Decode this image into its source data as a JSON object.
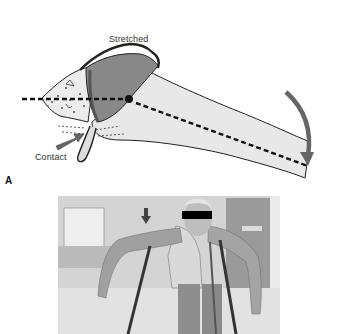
{
  "figure": {
    "panel_label": "A",
    "diagram": {
      "labels": {
        "stretched": "Stretched",
        "contact": "Contact"
      },
      "icons": {
        "rotation_arrow": "curved-arrow-down",
        "contact_arrow": "straight-arrow-right"
      },
      "colors": {
        "humeral_head": "#8a8a8a",
        "bone": "#e6e6e6",
        "arrow": "#666666",
        "outline": "#222222"
      }
    },
    "photo": {
      "description": "Grayscale photo of a person leaning forward with arms abducted between parallel bars; face obscured by black bar",
      "icons": {
        "indicator_arrow": "arrow-down",
        "censor_bar": "black-rectangle"
      }
    }
  }
}
